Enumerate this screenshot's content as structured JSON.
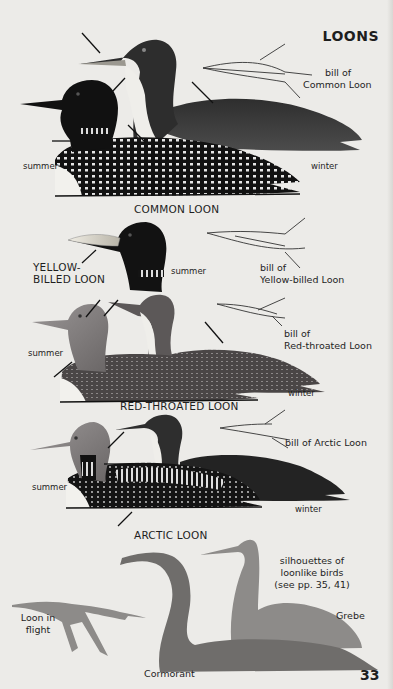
{
  "page": {
    "title": "LOONS",
    "page_number": "33"
  },
  "sections": {
    "common_loon": {
      "name": "COMMON LOON",
      "plumage_summer": "summer",
      "plumage_winter": "winter",
      "bill_label_line1": "bill of",
      "bill_label_line2": "Common Loon"
    },
    "yellow_billed_loon": {
      "name_line1": "YELLOW-",
      "name_line2": "BILLED LOON",
      "plumage_summer": "summer",
      "bill_label_line1": "bill of",
      "bill_label_line2": "Yellow-billed Loon"
    },
    "red_throated_loon": {
      "name": "RED-THROATED LOON",
      "plumage_summer": "summer",
      "plumage_winter": "winter",
      "bill_label_line1": "bill of",
      "bill_label_line2": "Red-throated Loon"
    },
    "arctic_loon": {
      "name": "ARCTIC LOON",
      "plumage_summer": "summer",
      "plumage_winter": "winter",
      "bill_label": "bill of Arctic Loon"
    },
    "silhouettes": {
      "caption_line1": "silhouettes of",
      "caption_line2": "loonlike birds",
      "caption_line3": "(see pp. 35, 41)",
      "loon_flight_line1": "Loon in",
      "loon_flight_line2": "flight",
      "cormorant": "Cormorant",
      "grebe": "Grebe"
    }
  },
  "colors": {
    "paper": "#ecebe8",
    "ink": "#1e1e1e",
    "loon_black": "#141414",
    "loon_gray": "#3a3a3a",
    "red_throated_gray": "#5a5656",
    "silhouette_light": "#8a8a8a",
    "silhouette_dark": "#6e6e6e"
  }
}
